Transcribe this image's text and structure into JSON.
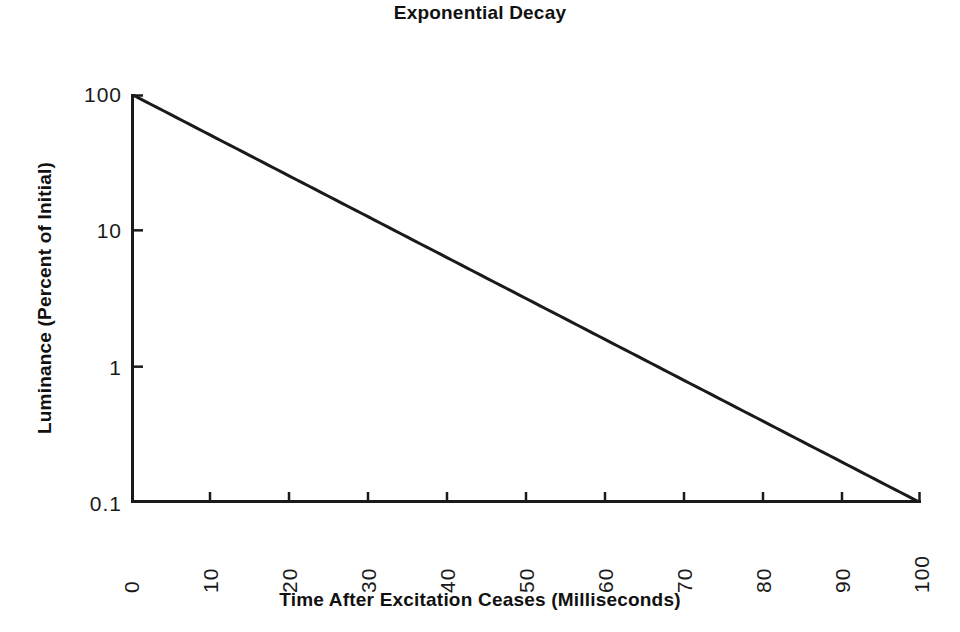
{
  "chart_data": {
    "type": "line",
    "title": "Exponential Decay",
    "xlabel": "Time After Excitation Ceases (Milliseconds)",
    "ylabel": "Luminance (Percent of Initial)",
    "xscale": "linear",
    "yscale": "log",
    "xlim": [
      0,
      100
    ],
    "ylim": [
      0.1,
      100
    ],
    "grid": false,
    "legend": null,
    "xticks": [
      "0",
      "10",
      "20",
      "30",
      "40",
      "50",
      "60",
      "70",
      "80",
      "90",
      "100"
    ],
    "xtick_values": [
      0,
      10,
      20,
      30,
      40,
      50,
      60,
      70,
      80,
      90,
      100
    ],
    "yticks": [
      "100",
      "10",
      "1",
      "0.1"
    ],
    "ytick_values": [
      100,
      10,
      1,
      0.1
    ],
    "series": [
      {
        "name": "Luminance decay",
        "color": "#1a1a1a",
        "line_width": 3,
        "x": [
          0,
          5,
          10,
          15,
          20,
          25,
          30,
          35,
          40,
          45,
          50,
          55,
          60,
          65,
          70,
          75,
          80,
          85,
          90,
          95,
          100
        ],
        "y": [
          100,
          63.1,
          39.8,
          25.1,
          15.8,
          10.0,
          6.31,
          3.98,
          2.51,
          1.58,
          1.0,
          0.631,
          0.398,
          0.251,
          0.158,
          0.1,
          0.0631,
          0.0398,
          0.0251,
          0.0158,
          0.1
        ]
      }
    ],
    "series_fitted": {
      "comment_not_rendered": "line is straight on log axes from (0,100) to (100,0.1)",
      "endpoints_x": [
        0,
        100
      ],
      "endpoints_y": [
        100,
        0.1
      ]
    },
    "axis_color": "#1a1a1a",
    "background": "#ffffff"
  },
  "geometry": {
    "plot_left": 131,
    "plot_top": 94,
    "plot_width": 790,
    "plot_height": 409
  }
}
